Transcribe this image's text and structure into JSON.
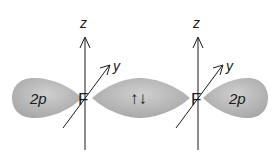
{
  "diagram": {
    "colors": {
      "orbital_fill": "#b8b8b8",
      "orbital_highlight": "#d0d0d0",
      "axis": "#1a1a1a",
      "background": "#ffffff"
    },
    "atoms": [
      {
        "symbol": "F",
        "axis_z_label": "z",
        "axis_y_label": "y",
        "lobe_label": "2p"
      },
      {
        "symbol": "F",
        "axis_z_label": "z",
        "axis_y_label": "y",
        "lobe_label": "2p"
      }
    ],
    "bond": {
      "electron_pair_label": "↑↓"
    }
  }
}
